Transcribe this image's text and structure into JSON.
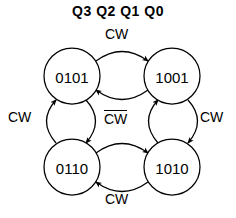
{
  "diagram": {
    "title": "Q3 Q2 Q1 Q0",
    "type": "state-transition-diagram",
    "background_color": "#ffffff",
    "stroke_color": "#000000",
    "states": [
      {
        "id": "s-0101",
        "label": "0101",
        "cx": 72,
        "cy": 76,
        "r": 28,
        "position": "top-left"
      },
      {
        "id": "s-1001",
        "label": "1001",
        "cx": 172,
        "cy": 76,
        "r": 28,
        "position": "top-right"
      },
      {
        "id": "s-0110",
        "label": "0110",
        "cx": 72,
        "cy": 167,
        "r": 28,
        "position": "bottom-left"
      },
      {
        "id": "s-1010",
        "label": "1010",
        "cx": 172,
        "cy": 167,
        "r": 28,
        "position": "bottom-right"
      }
    ],
    "labels": {
      "top": {
        "text": "CW",
        "overline": false
      },
      "left": {
        "text": "CW",
        "overline": false
      },
      "right": {
        "text": "CW",
        "overline": false
      },
      "bottom": {
        "text": "CW",
        "overline": false
      },
      "center": {
        "text": "CW",
        "overline": true
      }
    },
    "transitions": [
      {
        "from": "0101",
        "to": "1001",
        "condition": "CW",
        "arc": "top-outer",
        "label_ref": "top"
      },
      {
        "from": "1001",
        "to": "0101",
        "condition": "CW̅",
        "arc": "top-inner",
        "label_ref": "center"
      },
      {
        "from": "0110",
        "to": "0101",
        "condition": "CW",
        "arc": "left-outer",
        "label_ref": "left"
      },
      {
        "from": "0101",
        "to": "0110",
        "condition": "CW̅",
        "arc": "left-inner",
        "label_ref": "center"
      },
      {
        "from": "1001",
        "to": "1010",
        "condition": "CW",
        "arc": "right-outer",
        "label_ref": "right"
      },
      {
        "from": "1010",
        "to": "1001",
        "condition": "CW̅",
        "arc": "right-inner",
        "label_ref": "center"
      },
      {
        "from": "0110",
        "to": "1010",
        "condition": "CW̅",
        "arc": "bottom-inner",
        "label_ref": "center"
      },
      {
        "from": "1010",
        "to": "0110",
        "condition": "CW",
        "arc": "bottom-outer",
        "label_ref": "bottom"
      }
    ]
  }
}
